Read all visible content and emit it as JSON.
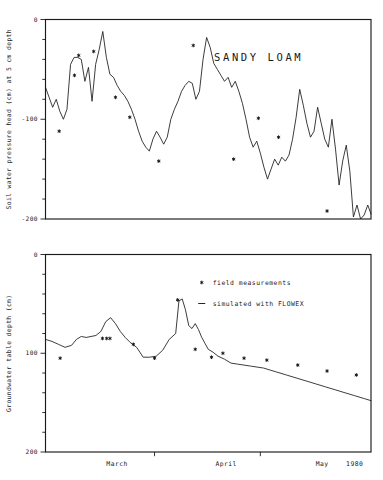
{
  "figure": {
    "background_color": "#ffffff",
    "ink_color": "#1a1a1a",
    "width": 383,
    "height": 480
  },
  "chart_data": [
    {
      "id": "soil-water-pressure-head",
      "type": "line",
      "title": "SANDY LOAM",
      "xlabel": "",
      "ylabel": "Soil water pressure head (cm) at 5 cm depth",
      "ylim": [
        -200,
        0
      ],
      "yticks": [
        0,
        -100,
        -200
      ],
      "ytick_labels": [
        "0",
        "-100",
        "-200"
      ],
      "yminor_step": 20,
      "xlim": [
        0,
        100
      ],
      "grid": false,
      "legend": null,
      "series": [
        {
          "name": "simulated with FLOWEX",
          "style": "line",
          "x": [
            0.0,
            1.1,
            2.2,
            3.3,
            4.4,
            5.5,
            6.6,
            7.7,
            8.8,
            9.9,
            11.0,
            12.1,
            13.2,
            14.3,
            15.4,
            16.5,
            17.6,
            18.7,
            19.8,
            20.9,
            22.0,
            23.1,
            24.2,
            25.3,
            26.4,
            27.5,
            28.6,
            29.7,
            30.8,
            31.9,
            33.0,
            34.1,
            35.2,
            36.3,
            37.4,
            38.5,
            39.6,
            40.7,
            41.8,
            42.9,
            44.0,
            45.1,
            46.2,
            47.3,
            48.4,
            49.5,
            50.6,
            51.7,
            52.8,
            53.9,
            55.0,
            56.1,
            57.2,
            58.3,
            59.4,
            60.5,
            61.6,
            62.7,
            63.8,
            64.9,
            66.0,
            67.1,
            68.2,
            69.3,
            70.4,
            71.5,
            72.6,
            73.7,
            74.8,
            75.9,
            77.0,
            78.1,
            79.2,
            80.3,
            81.4,
            82.5,
            83.6,
            84.7,
            85.8,
            86.9,
            88.0,
            89.1,
            90.2,
            91.3,
            92.4,
            93.5,
            94.6,
            95.7,
            96.8,
            97.9,
            99.0,
            100.0
          ],
          "y": [
            -68,
            -78,
            -88,
            -80,
            -92,
            -100,
            -90,
            -45,
            -38,
            -38,
            -40,
            -62,
            -48,
            -82,
            -45,
            -30,
            -12,
            -38,
            -55,
            -58,
            -66,
            -72,
            -76,
            -82,
            -90,
            -100,
            -112,
            -122,
            -128,
            -132,
            -120,
            -112,
            -118,
            -125,
            -118,
            -100,
            -90,
            -82,
            -72,
            -66,
            -62,
            -64,
            -80,
            -72,
            -40,
            -18,
            -28,
            -44,
            -50,
            -56,
            -62,
            -58,
            -68,
            -62,
            -72,
            -84,
            -100,
            -118,
            -128,
            -122,
            -134,
            -148,
            -160,
            -150,
            -140,
            -146,
            -138,
            -142,
            -136,
            -120,
            -98,
            -70,
            -86,
            -104,
            -118,
            -112,
            -88,
            -104,
            -120,
            -128,
            -100,
            -130,
            -166,
            -142,
            -126,
            -152,
            -198,
            -186,
            -200,
            -196,
            -186,
            -195
          ]
        },
        {
          "name": "field measurements",
          "style": "points",
          "x": [
            4.2,
            8.9,
            10.2,
            14.8,
            21.5,
            25.9,
            34.8,
            45.4,
            57.8,
            65.4,
            71.6,
            86.5
          ],
          "y": [
            -112,
            -56,
            -36,
            -32,
            -78,
            -98,
            -142,
            -26,
            -140,
            -99,
            -118,
            -192
          ]
        }
      ]
    },
    {
      "id": "groundwater-table-depth",
      "type": "line",
      "title": "",
      "xlabel": "",
      "ylabel": "Groundwater table depth (cm)",
      "ylim": [
        200,
        0
      ],
      "yticks": [
        0,
        100,
        200
      ],
      "ytick_labels": [
        "0",
        "100",
        "200"
      ],
      "yminor_step": 20,
      "xlim": [
        0,
        100
      ],
      "grid": false,
      "xcategories": [
        {
          "label": "March",
          "x": 22.0
        },
        {
          "label": "April",
          "x": 55.5
        },
        {
          "label": "May",
          "x": 85.0
        },
        {
          "label": "1980",
          "x": 95.0
        }
      ],
      "xtick_positions": [
        0.0,
        33.5,
        66.0,
        100.0
      ],
      "legend": {
        "position": "upper-right-inside",
        "entries": [
          {
            "marker": "star",
            "label": "field measurements"
          },
          {
            "marker": "dash",
            "label": "simulated with FLOWEX"
          }
        ]
      },
      "series": [
        {
          "name": "simulated with FLOWEX",
          "style": "line",
          "x": [
            0.0,
            2.0,
            4.0,
            6.0,
            8.0,
            9.5,
            11.0,
            12.5,
            14.0,
            15.5,
            17.0,
            18.5,
            20.0,
            21.5,
            23.0,
            24.5,
            26.0,
            28.0,
            30.0,
            32.0,
            34.0,
            36.0,
            38.0,
            40.0,
            41.0,
            42.0,
            43.0,
            44.0,
            45.0,
            46.0,
            47.0,
            48.0,
            49.0,
            50.0,
            51.5,
            53.0,
            55.0,
            57.0,
            59.0,
            61.0,
            63.0,
            65.0,
            67.0,
            69.0,
            71.0,
            74.0,
            77.0,
            80.0,
            83.0,
            86.0,
            89.0,
            92.0,
            95.0,
            98.0,
            100.0
          ],
          "y": [
            86,
            88,
            91,
            94,
            92,
            86,
            83,
            84,
            83,
            82,
            78,
            68,
            64,
            70,
            78,
            84,
            89,
            94,
            104,
            104,
            103,
            97,
            86,
            80,
            47,
            45,
            56,
            72,
            75,
            70,
            76,
            84,
            90,
            96,
            99,
            103,
            106,
            110,
            111,
            112,
            113,
            114,
            115,
            117,
            119,
            122,
            125,
            128,
            131,
            134,
            137,
            140,
            143,
            146,
            148
          ]
        },
        {
          "name": "field measurements",
          "style": "points",
          "x": [
            4.5,
            17.5,
            18.8,
            19.8,
            27.0,
            33.5,
            40.6,
            46.0,
            51.0,
            54.5,
            61.0,
            68.0,
            77.5,
            86.5,
            95.5
          ],
          "y": [
            105,
            85,
            85,
            85,
            91,
            105,
            46,
            96,
            104,
            100,
            105,
            107,
            112,
            118,
            122
          ]
        }
      ]
    }
  ]
}
